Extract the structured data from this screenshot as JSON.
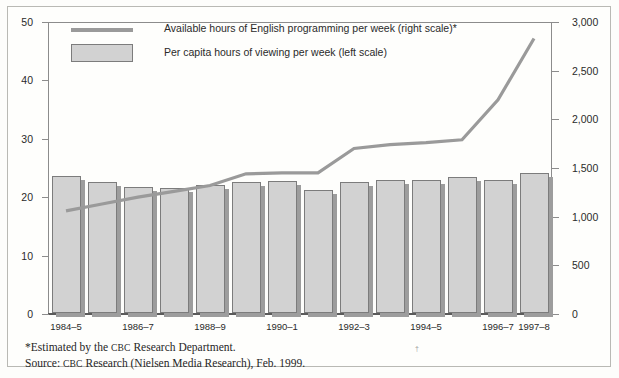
{
  "chart_data": {
    "type": "bar",
    "title": "",
    "subtitle": "",
    "xlabel": "",
    "ylabel": "",
    "grid": false,
    "legend_position": "top-left",
    "categories": [
      "1984–5",
      "1985–6",
      "1986–7",
      "1987–8",
      "1988–9",
      "1989–90",
      "1990–1",
      "1991–2",
      "1992–3",
      "1993–4",
      "1994–5",
      "1995–6",
      "1996–7",
      "1997–8"
    ],
    "tick_labels_shown": [
      "1984–5",
      "",
      "1986–7",
      "",
      "1988–9",
      "",
      "1990–1",
      "",
      "1992–3",
      "",
      "1994–5",
      "",
      "1996–7",
      "1997–8"
    ],
    "left_axis": {
      "label": "Per capita hours of viewing per week",
      "ticks": [
        "0",
        "10",
        "20",
        "30",
        "40",
        "50"
      ],
      "tick_values": [
        0,
        10,
        20,
        30,
        40,
        50
      ],
      "ylim": [
        0,
        50
      ]
    },
    "right_axis": {
      "label": "Available hours of English programming per week",
      "ticks": [
        "0",
        "500",
        "1,000",
        "1,500",
        "2,000",
        "2,500",
        "3,000"
      ],
      "tick_values": [
        0,
        500,
        1000,
        1500,
        2000,
        2500,
        3000
      ],
      "ylim": [
        0,
        3000
      ]
    },
    "series": [
      {
        "name": "Per capita hours of viewing per week (left scale)",
        "type": "bar",
        "axis": "left",
        "color": "#d2d2d2",
        "values": [
          23.4,
          22.4,
          21.6,
          21.4,
          21.9,
          22.4,
          22.6,
          21.1,
          22.5,
          22.8,
          22.8,
          23.3,
          22.8,
          23.9
        ]
      },
      {
        "name": "Available hours of English programming per week (right scale)*",
        "type": "line",
        "axis": "right",
        "color": "#9a9a9a",
        "values": [
          1060,
          1130,
          1200,
          1260,
          1320,
          1440,
          1450,
          1450,
          1700,
          1740,
          1760,
          1790,
          2200,
          2830
        ]
      }
    ]
  },
  "legend": {
    "items": [
      {
        "marker": "line-swatch",
        "label": "Available hours of English programming per week (right scale)*"
      },
      {
        "marker": "bar-swatch",
        "label": "Per capita hours of viewing per week (left scale)"
      }
    ]
  },
  "footnotes": {
    "estimated_prefix": "*Estimated by the ",
    "estimated_caps": "CBC",
    "estimated_suffix": " Research Department.",
    "source_prefix": "Source: ",
    "source_caps": "CBC",
    "source_suffix": " Research (Nielsen Media Research), Feb. 1999.",
    "stray_mark": "†"
  }
}
